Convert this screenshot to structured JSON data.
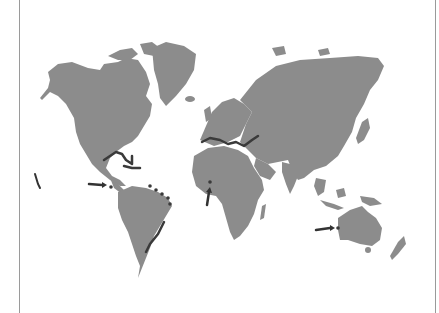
{
  "figure": {
    "type": "world-map",
    "style": "grayscale",
    "colors": {
      "background": "#ffffff",
      "land": "#8c8c8c",
      "highlight_coast": "#3a3a3a",
      "arrow": "#333333",
      "frame": "#9a9a9a"
    },
    "highlighted_regions": [
      "Gulf of Mexico / Caribbean coast",
      "Mediterranean and Black Sea coasts",
      "Southeast Brazil coast",
      "Northeast Brazil / Guianas coast"
    ],
    "arrows": [
      {
        "label": "arrow-eastern-pacific",
        "points_to": "Eastern Pacific island near Panama"
      },
      {
        "label": "arrow-west-africa",
        "points_to": "Gulf of Guinea coast"
      },
      {
        "label": "arrow-western-australia",
        "points_to": "Southwest Australia coast"
      }
    ],
    "marks": [
      {
        "label": "hawaii-mark",
        "location": "Hawaiian islands"
      }
    ]
  }
}
